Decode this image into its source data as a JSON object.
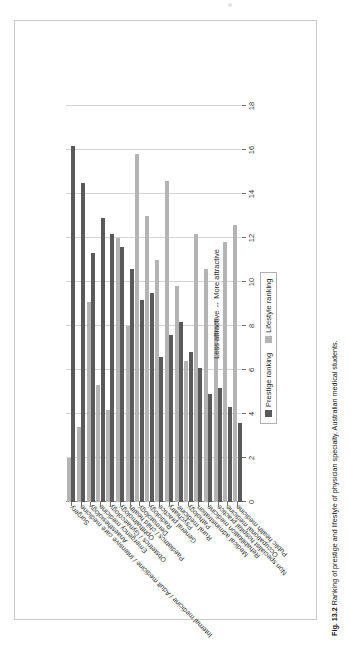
{
  "figure": {
    "caption_number": "Fig. 13.2",
    "caption_text": "Ranking of prestige and lifestyle of physician specialty, Australian medical students."
  },
  "legend": {
    "position": "below-plot",
    "items": [
      {
        "label": "Prestige ranking",
        "color": "#5a5a5a"
      },
      {
        "label": "Lifestyle ranking",
        "color": "#b4b4b4"
      }
    ]
  },
  "axis": {
    "value_axis_title": "Less attractive ↔ More attractive",
    "value_axis_title_left": "Less attractive",
    "value_axis_title_right": "More attractive",
    "tick_labels": [
      "0",
      "2",
      "4",
      "6",
      "8",
      "10",
      "12",
      "14",
      "16",
      "18"
    ]
  },
  "chart_data": {
    "type": "bar",
    "orientation": "horizontal",
    "title": "",
    "subtitle": "",
    "xlabel": "Less attractive ↔ More attractive",
    "ylabel": "",
    "xlim": [
      0,
      18
    ],
    "xticks": [
      0,
      2,
      4,
      6,
      8,
      10,
      12,
      14,
      16,
      18
    ],
    "grid": true,
    "grid_axis": "x",
    "legend_position": "below",
    "categories": [
      "Surgery",
      "Internal medicine / Adult medicine / Intensive care medicine",
      "Anaesthesiology",
      "Emergency medicine",
      "Obstetrics / Gynaecology",
      "Ophthalmology",
      "Paediatrics / child health",
      "Dermatology",
      "Radiology",
      "General practice",
      "Psychiatry",
      "Rural medicine",
      "Pathology",
      "Medical administration",
      "Rehabilitation medicine",
      "Non specialist hospital practice",
      "Occupational medicine",
      "Public health medicine"
    ],
    "series": [
      {
        "name": "Prestige ranking",
        "color": "#5a5a5a",
        "values": [
          16.2,
          14.5,
          11.3,
          12.9,
          12.2,
          11.6,
          10.6,
          9.2,
          9.5,
          6.6,
          7.6,
          8.2,
          6.8,
          6.1,
          4.9,
          5.2,
          4.3,
          3.6
        ]
      },
      {
        "name": "Lifestyle ranking",
        "color": "#b4b4b4",
        "values": [
          2.0,
          3.4,
          9.1,
          5.3,
          4.2,
          12.0,
          8.0,
          15.8,
          13.0,
          11.0,
          14.6,
          9.8,
          6.4,
          12.2,
          10.6,
          8.3,
          11.8,
          12.6
        ]
      }
    ]
  }
}
